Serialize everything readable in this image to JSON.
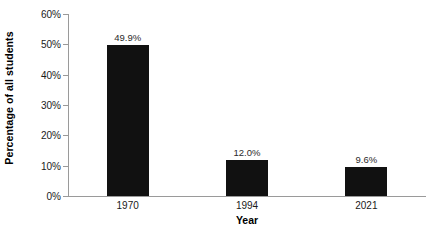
{
  "chart_data": {
    "type": "bar",
    "title": "",
    "subtitle": "",
    "xlabel": "Year",
    "ylabel": "Percentage of all students",
    "categories": [
      "1970",
      "1994",
      "2021"
    ],
    "values": [
      49.9,
      12.0,
      9.6
    ],
    "data_labels": [
      "49.9%",
      "12.0%",
      "9.6%"
    ],
    "ylim": [
      0,
      60
    ],
    "ytick_values": [
      0,
      10,
      20,
      30,
      40,
      50,
      60
    ],
    "ytick_labels": [
      "0%",
      "10%",
      "20%",
      "30%",
      "40%",
      "50%",
      "60%"
    ],
    "grid": false,
    "legend": null,
    "legend_position": "none",
    "bar_color": "#111111",
    "axis_color": "#9a9a9a",
    "background_color": "#ffffff",
    "label_color": "#2b2b2b"
  }
}
